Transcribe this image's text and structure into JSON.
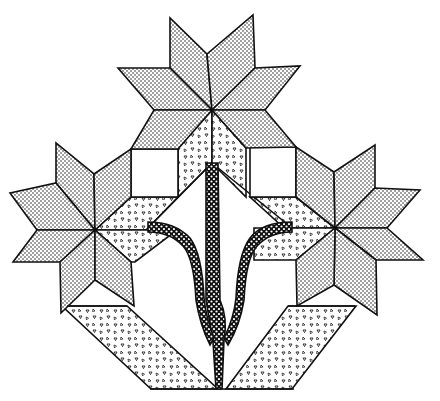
{
  "figure": {
    "title": "Quilt block: three eight-pointed stars with stem and baskets",
    "colors": {
      "outline": "#111111",
      "background": "#ffffff",
      "dot_fill": "#111111",
      "triangle_fill": "#111111"
    },
    "fabrics": [
      {
        "id": "fine-dot",
        "label": "fine dotted fabric",
        "used_for": "star diamonds"
      },
      {
        "id": "triangle-print",
        "label": "triangle print fabric",
        "used_for": "setting triangles and baskets"
      },
      {
        "id": "coarse-dot",
        "label": "coarse dotted fabric",
        "used_for": "stem"
      },
      {
        "id": "plain",
        "label": "plain white",
        "used_for": "squares and background"
      }
    ],
    "elements": {
      "stars": [
        {
          "name": "top-star",
          "center": [
            212,
            110
          ],
          "points": 8
        },
        {
          "name": "left-star",
          "center": [
            95,
            230
          ],
          "points": 8
        },
        {
          "name": "right-star",
          "center": [
            335,
            228
          ],
          "points": 8
        }
      ],
      "squares": [
        {
          "name": "left-white-square",
          "x": 131,
          "y": 149,
          "w": 47,
          "h": 48
        },
        {
          "name": "right-white-square",
          "x": 250,
          "y": 147,
          "w": 46,
          "h": 50
        }
      ],
      "baskets": [
        {
          "name": "left-basket-strip"
        },
        {
          "name": "right-basket-strip"
        }
      ],
      "stem": {
        "name": "branching-stem",
        "branches": 3
      }
    }
  }
}
